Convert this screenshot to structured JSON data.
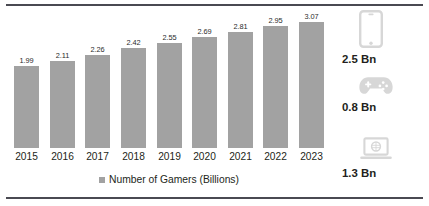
{
  "chart_data": {
    "type": "bar",
    "title": "",
    "subtitle": "",
    "xlabel": "",
    "ylabel": "",
    "ylim": [
      0,
      3.35
    ],
    "grid": false,
    "legend_position": "bottom",
    "categories": [
      "2015",
      "2016",
      "2017",
      "2018",
      "2019",
      "2020",
      "2021",
      "2022",
      "2023"
    ],
    "values": [
      1.99,
      2.11,
      2.26,
      2.42,
      2.55,
      2.69,
      2.81,
      2.95,
      3.07
    ],
    "value_labels": [
      "1.99",
      "2.11",
      "2.26",
      "2.42",
      "2.55",
      "2.69",
      "2.81",
      "2.95",
      "3.07"
    ],
    "series": [
      {
        "name": "Number of Gamers (Billions)",
        "values": [
          1.99,
          2.11,
          2.26,
          2.42,
          2.55,
          2.69,
          2.81,
          2.95,
          3.07
        ],
        "color": "#a2a2a2"
      }
    ],
    "legend": [
      "Number of Gamers (Billions)"
    ],
    "annotations": [
      {
        "icon": "smartphone-icon",
        "value": "2.5 Bn"
      },
      {
        "icon": "gamepad-icon",
        "value": "0.8 Bn"
      },
      {
        "icon": "laptop-icon",
        "value": "1.3 Bn"
      }
    ]
  },
  "legend": {
    "label": "Number of Gamers (Billions)",
    "swatch_color": "#a2a2a2"
  },
  "side_panel": {
    "items": [
      {
        "icon_name": "smartphone-icon",
        "value": "2.5 Bn"
      },
      {
        "icon_name": "gamepad-icon",
        "value": "0.8 Bn"
      },
      {
        "icon_name": "laptop-icon",
        "value": "1.3 Bn"
      }
    ]
  },
  "colors": {
    "bar": "#a2a2a2",
    "rule": "#4a4a52",
    "icon": "#d7d7d7",
    "text": "#231f20",
    "background": "#ffffff"
  }
}
